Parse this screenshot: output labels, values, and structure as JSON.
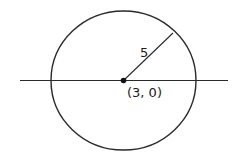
{
  "diagram": {
    "type": "circle-with-radius",
    "center_label": "(3, 0)",
    "radius_label": "5",
    "colors": {
      "stroke": "#2a2a2a",
      "text": "#1a1a1a",
      "background": "#ffffff"
    }
  }
}
